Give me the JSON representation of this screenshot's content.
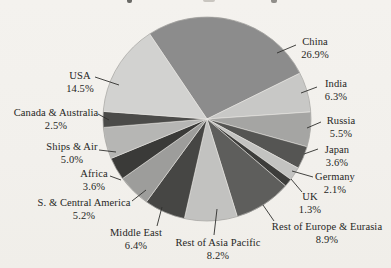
{
  "figure": {
    "background_color": "#f2f0ec",
    "text_color": "#262624",
    "leader_line_color": "#2f2f2d",
    "title_cropped_remnant": "partial ink marks of a cut-off title along the top edge"
  },
  "chart_data": {
    "type": "pie",
    "title": "",
    "legend": "none (direct slice labels with leader lines)",
    "units": "percent",
    "start_angle_deg_cw_from_top": -33.5,
    "center": [
      207,
      119
    ],
    "radius": [
      104,
      102
    ],
    "categories": [
      "China",
      "India",
      "Russia",
      "Japan",
      "Germany",
      "UK",
      "Rest of Europe & Eurasia",
      "Rest of Asia Pacific",
      "Middle East",
      "S. & Central America",
      "Africa",
      "Ships & Air",
      "Canada & Australia",
      "USA"
    ],
    "values": [
      26.9,
      6.3,
      5.5,
      3.6,
      2.1,
      1.3,
      8.9,
      8.2,
      6.4,
      5.2,
      3.6,
      5.0,
      2.5,
      14.5
    ],
    "slices": [
      {
        "label": "China",
        "value": 26.9,
        "pct_label": "26.9%",
        "color": "#8c8c8c",
        "label_pos": [
          315,
          36
        ],
        "leader": [
          277,
          53,
          296,
          45
        ]
      },
      {
        "label": "India",
        "value": 6.3,
        "pct_label": "6.3%",
        "color": "#c8c8c6",
        "label_pos": [
          336,
          78
        ],
        "leader": [
          301,
          93,
          317,
          87
        ]
      },
      {
        "label": "Russia",
        "value": 5.5,
        "pct_label": "5.5%",
        "color": "#a5a5a3",
        "label_pos": [
          341,
          115
        ],
        "leader": [
          307,
          128,
          321,
          122
        ]
      },
      {
        "label": "Japan",
        "value": 3.6,
        "pct_label": "3.6%",
        "color": "#555553",
        "label_pos": [
          337,
          144
        ],
        "leader": [
          304,
          154,
          318,
          149
        ]
      },
      {
        "label": "Germany",
        "value": 2.1,
        "pct_label": "2.1%",
        "color": "#c3c3c1",
        "label_pos": [
          335,
          171
        ],
        "leader": [
          292,
          171,
          313,
          177
        ]
      },
      {
        "label": "UK",
        "value": 1.3,
        "pct_label": "1.3%",
        "color": "#3d3d3b",
        "label_pos": [
          310,
          191
        ],
        "leader": [
          291,
          179,
          302,
          192
        ]
      },
      {
        "label": "Rest of Europe & Eurasia",
        "value": 8.9,
        "pct_label": "8.9%",
        "color": "#5e5e5c",
        "label_pos": [
          327,
          221
        ],
        "leader": [
          263,
          205,
          274,
          221
        ]
      },
      {
        "label": "Rest of Asia Pacific",
        "value": 8.2,
        "pct_label": "8.2%",
        "color": "#c2c2c0",
        "label_pos": [
          218,
          237
        ],
        "leader": [
          217,
          209,
          214,
          235
        ]
      },
      {
        "label": "Middle East",
        "value": 6.4,
        "pct_label": "6.4%",
        "color": "#464644",
        "label_pos": [
          136,
          227
        ],
        "leader": [
          162,
          207,
          157,
          226
        ]
      },
      {
        "label": "S. & Central America",
        "value": 5.2,
        "pct_label": "5.2%",
        "color": "#9d9d9b",
        "label_pos": [
          84,
          197
        ],
        "leader": [
          146,
          190,
          132,
          201
        ]
      },
      {
        "label": "Africa",
        "value": 3.6,
        "pct_label": "3.6%",
        "color": "#3a3a38",
        "label_pos": [
          94,
          168
        ],
        "leader": [
          121,
          180,
          110,
          176
        ]
      },
      {
        "label": "Ships & Air",
        "value": 5.0,
        "pct_label": "5.0%",
        "color": "#b6b6b4",
        "label_pos": [
          72,
          141
        ],
        "leader": [
          116,
          152,
          99,
          150
        ]
      },
      {
        "label": "Canada & Australia",
        "value": 2.5,
        "pct_label": "2.5%",
        "color": "#4b4b49",
        "label_pos": [
          56,
          107
        ],
        "leader": [
          109,
          120,
          98,
          114
        ]
      },
      {
        "label": "USA",
        "value": 14.5,
        "pct_label": "14.5%",
        "color": "#d2d2d0",
        "label_pos": [
          80,
          70
        ],
        "leader": [
          119,
          85,
          95,
          77
        ]
      }
    ],
    "layout_hints": {
      "label_alignment": "centered two-line blocks (name over percent)",
      "slice_seam_color": "#eceae6",
      "rim_color": "#6e6e6a"
    }
  }
}
